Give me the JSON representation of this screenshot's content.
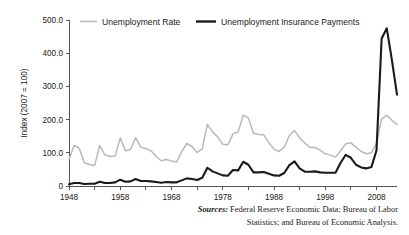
{
  "figure": {
    "background": "#ffffff",
    "width": 409,
    "height": 235
  },
  "source_note": {
    "label": "Sources:",
    "text": " Federal Reserve Economic Data; Bureau of Labor Statistics; and Bureau of Economic Analysis."
  },
  "chart_data": {
    "type": "line",
    "title": "",
    "xlabel": "",
    "ylabel": "Index (2007 = 100)",
    "xlim": [
      1948,
      2012
    ],
    "ylim": [
      0,
      500
    ],
    "grid": false,
    "legend_position": "top",
    "x_tick_labels": [
      "1948",
      "1958",
      "1968",
      "1978",
      "1988",
      "1998",
      "2008"
    ],
    "x_ticks": [
      1948,
      1958,
      1968,
      1978,
      1988,
      1998,
      2008
    ],
    "x_minor_ticks": [
      1953,
      1963,
      1973,
      1983,
      1993,
      2003
    ],
    "y_tick_labels": [
      "0",
      "100.0",
      "200.0",
      "300.0",
      "400.0",
      "500.0"
    ],
    "y_ticks": [
      0,
      100,
      200,
      300,
      400,
      500
    ],
    "series": [
      {
        "name": "Unemployment Rate",
        "color": "#b9b9b9",
        "width": 1.5,
        "x": [
          1948,
          1949,
          1950,
          1951,
          1952,
          1953,
          1954,
          1955,
          1956,
          1957,
          1958,
          1959,
          1960,
          1961,
          1962,
          1963,
          1964,
          1965,
          1966,
          1967,
          1968,
          1969,
          1970,
          1971,
          1972,
          1973,
          1974,
          1975,
          1976,
          1977,
          1978,
          1979,
          1980,
          1981,
          1982,
          1983,
          1984,
          1985,
          1986,
          1987,
          1988,
          1989,
          1990,
          1991,
          1992,
          1993,
          1994,
          1995,
          1996,
          1997,
          1998,
          1999,
          2000,
          2001,
          2002,
          2003,
          2004,
          2005,
          2006,
          2007,
          2008,
          2009,
          2010,
          2011,
          2012
        ],
        "values": [
          80,
          122,
          114,
          70,
          65,
          62,
          122,
          94,
          89,
          90,
          145,
          106,
          110,
          146,
          117,
          113,
          106,
          89,
          76,
          80,
          75,
          72,
          104,
          128,
          119,
          101,
          112,
          186,
          163,
          148,
          126,
          124,
          157,
          163,
          213,
          205,
          159,
          155,
          154,
          130,
          111,
          104,
          117,
          152,
          167,
          145,
          130,
          116,
          116,
          108,
          97,
          93,
          87,
          106,
          127,
          130,
          117,
          104,
          97,
          100,
          129,
          202,
          213,
          198,
          185
        ]
      },
      {
        "name": "Unemployment Insurance Payments",
        "color": "#1a1a1a",
        "width": 2.1,
        "x": [
          1948,
          1949,
          1950,
          1951,
          1952,
          1953,
          1954,
          1955,
          1956,
          1957,
          1958,
          1959,
          1960,
          1961,
          1962,
          1963,
          1964,
          1965,
          1966,
          1967,
          1968,
          1969,
          1970,
          1971,
          1972,
          1973,
          1974,
          1975,
          1976,
          1977,
          1978,
          1979,
          1980,
          1981,
          1982,
          1983,
          1984,
          1985,
          1986,
          1987,
          1988,
          1989,
          1990,
          1991,
          1992,
          1993,
          1994,
          1995,
          1996,
          1997,
          1998,
          1999,
          2000,
          2001,
          2002,
          2003,
          2004,
          2005,
          2006,
          2007,
          2008,
          2009,
          2010,
          2011,
          2012
        ],
        "values": [
          5,
          9,
          9,
          6,
          7,
          7,
          13,
          9,
          9,
          11,
          19,
          13,
          14,
          21,
          15,
          15,
          14,
          12,
          10,
          12,
          11,
          11,
          17,
          23,
          21,
          18,
          25,
          55,
          44,
          38,
          32,
          31,
          48,
          47,
          73,
          64,
          41,
          41,
          42,
          37,
          32,
          31,
          39,
          63,
          74,
          53,
          43,
          43,
          44,
          41,
          40,
          40,
          40,
          70,
          94,
          85,
          64,
          56,
          53,
          57,
          107,
          444,
          475,
          380,
          275
        ]
      }
    ],
    "legend": [
      {
        "label": "Unemployment Rate",
        "color": "#b9b9b9",
        "width": 1.6
      },
      {
        "label": "Unemployment Insurance Payments",
        "color": "#1a1a1a",
        "width": 2.4
      }
    ]
  }
}
